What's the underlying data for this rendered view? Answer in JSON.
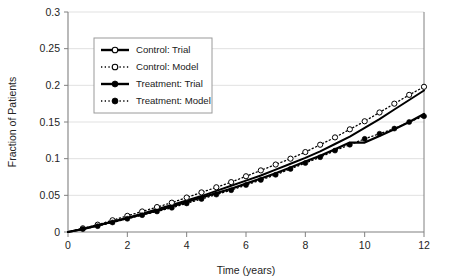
{
  "chart_data": {
    "type": "line",
    "title": "",
    "xlabel": "Time (years)",
    "ylabel": "Fraction of Patients",
    "xlim": [
      0,
      12
    ],
    "ylim": [
      0,
      0.3
    ],
    "xticks": [
      0,
      2,
      4,
      6,
      8,
      10,
      12
    ],
    "xtick_labels": [
      "0",
      "2",
      "4",
      "6",
      "8",
      "10",
      "12"
    ],
    "yticks": [
      0,
      0.05,
      0.1,
      0.15,
      0.2,
      0.25,
      0.3
    ],
    "ytick_labels": [
      "0",
      "0.05",
      "0.1",
      "0.15",
      "0.2",
      "0.25",
      "0.3"
    ],
    "grid": "horizontal",
    "grid_color": "#d9d9d9",
    "axis_color": "#808080",
    "legend_position": "upper-left-inset",
    "series": [
      {
        "name": "Control: Trial",
        "style": "solid-line-with-open-circles",
        "color": "#000000",
        "marker": "open-circle",
        "x": [
          0,
          0.5,
          1,
          1.5,
          2,
          2.5,
          3,
          3.5,
          4,
          4.5,
          5,
          5.5,
          6,
          6.5,
          7,
          7.5,
          8,
          8.5,
          9,
          9.5,
          10,
          10.5,
          11,
          11.5,
          12
        ],
        "y": [
          0,
          0.004,
          0.009,
          0.014,
          0.019,
          0.025,
          0.031,
          0.037,
          0.043,
          0.049,
          0.056,
          0.063,
          0.07,
          0.077,
          0.085,
          0.093,
          0.101,
          0.11,
          0.12,
          0.13,
          0.142,
          0.154,
          0.167,
          0.18,
          0.193
        ]
      },
      {
        "name": "Control: Model",
        "style": "dotted-line-with-open-circles",
        "color": "#000000",
        "marker": "open-circle",
        "x": [
          0,
          0.5,
          1,
          1.5,
          2,
          2.5,
          3,
          3.5,
          4,
          4.5,
          5,
          5.5,
          6,
          6.5,
          7,
          7.5,
          8,
          8.5,
          9,
          9.5,
          10,
          10.5,
          11,
          11.5,
          12
        ],
        "y": [
          0,
          0.005,
          0.01,
          0.016,
          0.022,
          0.028,
          0.034,
          0.04,
          0.047,
          0.054,
          0.061,
          0.068,
          0.076,
          0.084,
          0.092,
          0.1,
          0.109,
          0.119,
          0.129,
          0.14,
          0.151,
          0.163,
          0.175,
          0.187,
          0.198
        ]
      },
      {
        "name": "Treatment: Trial",
        "style": "solid-line-bold",
        "color": "#000000",
        "marker": "filled-circle",
        "x": [
          0,
          0.5,
          1,
          1.5,
          2,
          2.5,
          3,
          3.5,
          4,
          4.5,
          5,
          5.5,
          6,
          6.5,
          7,
          7.5,
          8,
          8.5,
          9,
          9.5,
          10,
          10.5,
          11,
          11.5,
          12
        ],
        "y": [
          0,
          0.004,
          0.009,
          0.014,
          0.019,
          0.024,
          0.029,
          0.035,
          0.041,
          0.047,
          0.053,
          0.059,
          0.066,
          0.073,
          0.08,
          0.088,
          0.096,
          0.104,
          0.113,
          0.122,
          0.122,
          0.131,
          0.14,
          0.15,
          0.161
        ]
      },
      {
        "name": "Treatment: Model",
        "style": "dotted-line-with-filled-circles",
        "color": "#000000",
        "marker": "filled-circle",
        "x": [
          0,
          0.5,
          1,
          1.5,
          2,
          2.5,
          3,
          3.5,
          4,
          4.5,
          5,
          5.5,
          6,
          6.5,
          7,
          7.5,
          8,
          8.5,
          9,
          9.5,
          10,
          10.5,
          11,
          11.5,
          12
        ],
        "y": [
          0,
          0.004,
          0.008,
          0.013,
          0.018,
          0.023,
          0.028,
          0.033,
          0.039,
          0.045,
          0.051,
          0.057,
          0.064,
          0.071,
          0.078,
          0.086,
          0.094,
          0.102,
          0.111,
          0.119,
          0.127,
          0.134,
          0.141,
          0.15,
          0.158
        ]
      }
    ],
    "legend": [
      {
        "label": "Control: Trial",
        "marker": "open-circle",
        "line": "solid"
      },
      {
        "label": "Control: Model",
        "marker": "open-circle",
        "line": "dotted"
      },
      {
        "label": "Treatment: Trial",
        "marker": "filled-circle",
        "line": "solid"
      },
      {
        "label": "Treatment: Model",
        "marker": "filled-circle",
        "line": "dotted"
      }
    ]
  }
}
